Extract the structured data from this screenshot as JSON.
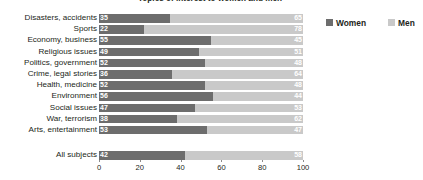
{
  "chart": {
    "title": "Topics of interest to women and men",
    "legend": {
      "position": "top-right",
      "entries": [
        {
          "label": "Women",
          "color": "#6d6d6d"
        },
        {
          "label": "Men",
          "color": "#c9c9c9"
        }
      ]
    }
  },
  "chart_data": {
    "type": "bar",
    "orientation": "horizontal",
    "stacked": true,
    "normalized_percent": true,
    "title": "Topics of interest to women and men",
    "xlabel": "",
    "ylabel": "",
    "xlim": [
      0,
      100
    ],
    "ticks": [
      0,
      20,
      40,
      60,
      80,
      100
    ],
    "grid": false,
    "categories": [
      "Disasters, accidents",
      "Sports",
      "Economy, business",
      "Religious issues",
      "Politics, government",
      "Crime, legal stories",
      "Health, medicine",
      "Environment",
      "Social issues",
      "War, terrorism",
      "Arts, entertainment"
    ],
    "series": [
      {
        "name": "Women",
        "color": "#6d6d6d",
        "values": [
          35,
          22,
          55,
          49,
          52,
          36,
          52,
          56,
          47,
          38,
          53
        ]
      },
      {
        "name": "Men",
        "color": "#c9c9c9",
        "values": [
          65,
          78,
          45,
          51,
          48,
          64,
          48,
          44,
          53,
          62,
          47
        ]
      }
    ],
    "total_row": {
      "category": "All subjects",
      "values": {
        "Women": 42,
        "Men": 58
      }
    }
  }
}
